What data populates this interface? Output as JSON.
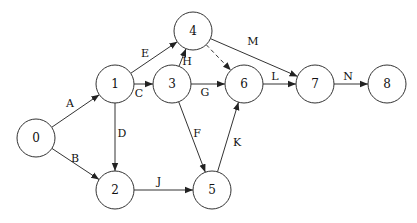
{
  "diagram": {
    "type": "activity-on-arrow network",
    "nodes": [
      {
        "id": "0",
        "label": "0",
        "x": 36,
        "y": 138
      },
      {
        "id": "1",
        "label": "1",
        "x": 115,
        "y": 84
      },
      {
        "id": "2",
        "label": "2",
        "x": 115,
        "y": 190
      },
      {
        "id": "3",
        "label": "3",
        "x": 172,
        "y": 84
      },
      {
        "id": "4",
        "label": "4",
        "x": 193,
        "y": 31
      },
      {
        "id": "5",
        "label": "5",
        "x": 212,
        "y": 190
      },
      {
        "id": "6",
        "label": "6",
        "x": 244,
        "y": 84
      },
      {
        "id": "7",
        "label": "7",
        "x": 315,
        "y": 84
      },
      {
        "id": "8",
        "label": "8",
        "x": 387,
        "y": 84
      }
    ],
    "node_radius": 19,
    "edges": [
      {
        "id": "A",
        "label": "A",
        "from": "0",
        "to": "1",
        "dashed": false,
        "lx": 70,
        "ly": 103
      },
      {
        "id": "B",
        "label": "B",
        "from": "0",
        "to": "2",
        "dashed": false,
        "lx": 75,
        "ly": 158
      },
      {
        "id": "C",
        "label": "C",
        "from": "1",
        "to": "3",
        "dashed": false,
        "lx": 139,
        "ly": 93
      },
      {
        "id": "D",
        "label": "D",
        "from": "1",
        "to": "2",
        "dashed": false,
        "lx": 122,
        "ly": 133
      },
      {
        "id": "E",
        "label": "E",
        "from": "1",
        "to": "4",
        "dashed": false,
        "lx": 145,
        "ly": 53
      },
      {
        "id": "F",
        "label": "F",
        "from": "3",
        "to": "5",
        "dashed": false,
        "lx": 197,
        "ly": 133
      },
      {
        "id": "G",
        "label": "G",
        "from": "3",
        "to": "6",
        "dashed": false,
        "lx": 205,
        "ly": 92
      },
      {
        "id": "H",
        "label": "H",
        "from": "3",
        "to": "4",
        "dashed": false,
        "lx": 187,
        "ly": 61
      },
      {
        "id": "I",
        "label": "",
        "from": "4",
        "to": "6",
        "dashed": true,
        "lx": 0,
        "ly": 0
      },
      {
        "id": "J",
        "label": "J",
        "from": "2",
        "to": "5",
        "dashed": false,
        "lx": 159,
        "ly": 181
      },
      {
        "id": "K",
        "label": "K",
        "from": "5",
        "to": "6",
        "dashed": false,
        "lx": 237,
        "ly": 142
      },
      {
        "id": "L",
        "label": "L",
        "from": "6",
        "to": "7",
        "dashed": false,
        "lx": 275,
        "ly": 76
      },
      {
        "id": "M",
        "label": "M",
        "from": "4",
        "to": "7",
        "dashed": false,
        "lx": 253,
        "ly": 41
      },
      {
        "id": "N",
        "label": "N",
        "from": "7",
        "to": "8",
        "dashed": false,
        "lx": 348,
        "ly": 76
      }
    ],
    "colors": {
      "stroke": "#333333",
      "text": "#111111",
      "background": "#ffffff"
    }
  }
}
